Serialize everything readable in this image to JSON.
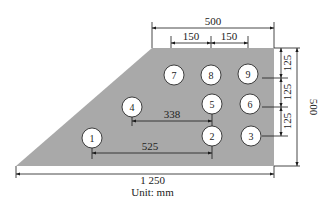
{
  "diagram": {
    "unit_label": "Unit: mm",
    "colors": {
      "plate_fill": "#a9a9a9",
      "line": "#1a1a1a",
      "circle_fill": "#ffffff"
    },
    "plate": {
      "points": "152,48 274,48 274,166 16,166"
    },
    "points": [
      {
        "label": "1",
        "cx": 92,
        "cy": 138
      },
      {
        "label": "2",
        "cx": 212,
        "cy": 136
      },
      {
        "label": "3",
        "cx": 251,
        "cy": 136
      },
      {
        "label": "4",
        "cx": 132,
        "cy": 107
      },
      {
        "label": "5",
        "cx": 212,
        "cy": 104
      },
      {
        "label": "6",
        "cx": 250,
        "cy": 104
      },
      {
        "label": "7",
        "cx": 174,
        "cy": 75
      },
      {
        "label": "8",
        "cx": 211,
        "cy": 75
      },
      {
        "label": "9",
        "cx": 248,
        "cy": 74
      }
    ],
    "dimensions": {
      "top_total": "500",
      "top_spacing_1": "150",
      "top_spacing_2": "150",
      "right_spacing_1": "125",
      "right_spacing_2": "125",
      "right_spacing_3": "125",
      "right_total": "500",
      "bottom_total": "1 250",
      "dist_4_5": "338",
      "dist_1_2": "525"
    }
  }
}
